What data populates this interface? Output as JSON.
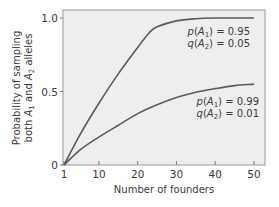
{
  "chart_data": {
    "type": "line",
    "title": "",
    "xlabel": "Number of founders",
    "ylabel_lines": [
      "Probability of sampling",
      "both A1 and A2 alleles"
    ],
    "xlim": [
      1,
      52
    ],
    "ylim": [
      0,
      1.05
    ],
    "x_ticks": [
      1,
      10,
      20,
      30,
      40,
      50
    ],
    "x_tick_labels": [
      "1",
      "10",
      "20",
      "30",
      "40",
      "50"
    ],
    "y_ticks": [
      0,
      0.5,
      1.0
    ],
    "y_tick_labels": [
      "0",
      "0.5",
      "1.0"
    ],
    "grid": false,
    "background": "#eeeeee",
    "line_color": "#5a5a5a",
    "series": [
      {
        "name": "p(A1) = 0.95, q(A2) = 0.05",
        "label_line1": "p(A1) = 0.95",
        "label_line2": "q(A2) = 0.05",
        "x": [
          1,
          5,
          10,
          15,
          20,
          23,
          25,
          30,
          35,
          40,
          45,
          50
        ],
        "values": [
          0,
          0.2,
          0.42,
          0.62,
          0.8,
          0.9,
          0.94,
          0.98,
          0.995,
          1.0,
          1.0,
          1.0
        ]
      },
      {
        "name": "p(A1) = 0.99, q(A2) = 0.01",
        "label_line1": "p(A1) = 0.99",
        "label_line2": "q(A2) = 0.01",
        "x": [
          1,
          5,
          10,
          15,
          20,
          25,
          30,
          35,
          40,
          45,
          50
        ],
        "values": [
          0,
          0.1,
          0.19,
          0.27,
          0.35,
          0.41,
          0.46,
          0.495,
          0.52,
          0.54,
          0.55
        ]
      }
    ]
  }
}
